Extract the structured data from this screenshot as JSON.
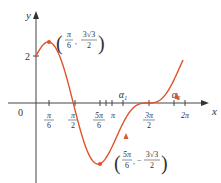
{
  "chart_data": {
    "type": "line",
    "function": "f(x) = 2cos x + sin 2x",
    "xlabel": "x",
    "ylabel": "y",
    "origin_label": "0",
    "x_ticks": [
      {
        "value": 0.5236,
        "num": "π",
        "den": "6"
      },
      {
        "value": 1.5708,
        "num": "π",
        "den": "2"
      },
      {
        "value": 2.618,
        "num": "5π",
        "den": "6"
      },
      {
        "value": 3.1416,
        "label": "π"
      },
      {
        "value": 4.7124,
        "num": "3π",
        "den": "2"
      },
      {
        "value": 6.2832,
        "label": "2π"
      }
    ],
    "x_markers": [
      {
        "label": "α₁",
        "value": 3.6
      },
      {
        "label": "α₂",
        "value": 5.85
      }
    ],
    "y_ticks": [
      {
        "value": 2,
        "label": "2"
      }
    ],
    "annotations": [
      {
        "point": [
          0.5236,
          2.598
        ],
        "text": "(π/6, 3√3/2)",
        "num1": "π",
        "den1": "6",
        "num2": "3√3",
        "den2": "2",
        "sign": ""
      },
      {
        "point": [
          2.618,
          -2.598
        ],
        "text": "(5π/6, −3√3/2)",
        "num1": "5π",
        "den1": "6",
        "num2": "3√3",
        "den2": "2",
        "sign": "−"
      }
    ],
    "xlim": [
      0,
      6.6
    ],
    "ylim": [
      -2.8,
      3.1
    ],
    "curve_color": "#e0522a",
    "grid": false
  }
}
